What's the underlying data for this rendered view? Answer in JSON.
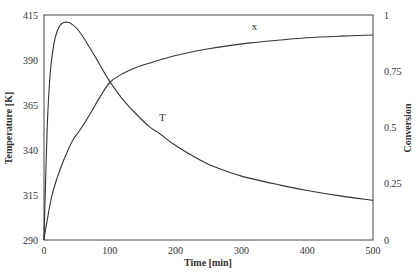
{
  "chart_data": {
    "type": "line",
    "title": "",
    "xlabel": "Time [min]",
    "ylabel_left": "Temperature [K]",
    "ylabel_right": "Conversion",
    "xlim": [
      0,
      500
    ],
    "ylim_left": [
      290,
      415
    ],
    "ylim_right": [
      0,
      1
    ],
    "x_ticks": [
      "0",
      "100",
      "200",
      "300",
      "400",
      "500"
    ],
    "y_left_ticks": [
      "290",
      "315",
      "340",
      "365",
      "390",
      "415"
    ],
    "y_right_ticks": [
      "0",
      "0.25",
      "0.5",
      "0.75",
      "1"
    ],
    "grid": false,
    "legend": "inline labels",
    "series": [
      {
        "name": "T",
        "axis": "left",
        "label": "T",
        "label_pos": [
          180,
          354
        ],
        "x": [
          0,
          3,
          6,
          10,
          15,
          20,
          25,
          30,
          35,
          40,
          50,
          60,
          70,
          80,
          90,
          100,
          120,
          140,
          160,
          176,
          200,
          237,
          260,
          300,
          359,
          400,
          450,
          500
        ],
        "values": [
          290,
          330,
          362,
          385,
          399,
          406,
          409.5,
          410.8,
          411,
          410.5,
          407.5,
          402.5,
          396.5,
          390.5,
          384,
          378,
          368,
          360,
          353,
          349,
          342.5,
          334.5,
          330.5,
          325.5,
          320.5,
          317.5,
          314.5,
          312
        ]
      },
      {
        "name": "x",
        "axis": "right",
        "label": "x",
        "label_pos": [
          320,
          0.915
        ],
        "x": [
          0,
          2,
          5,
          10,
          15,
          24,
          35,
          45,
          55,
          70,
          85,
          100,
          120,
          140,
          161,
          200,
          250,
          313,
          360,
          400,
          450,
          500
        ],
        "values": [
          0,
          0.04,
          0.09,
          0.17,
          0.23,
          0.31,
          0.39,
          0.45,
          0.49,
          0.56,
          0.635,
          0.7,
          0.74,
          0.767,
          0.787,
          0.82,
          0.85,
          0.876,
          0.889,
          0.899,
          0.906,
          0.911
        ]
      }
    ]
  }
}
